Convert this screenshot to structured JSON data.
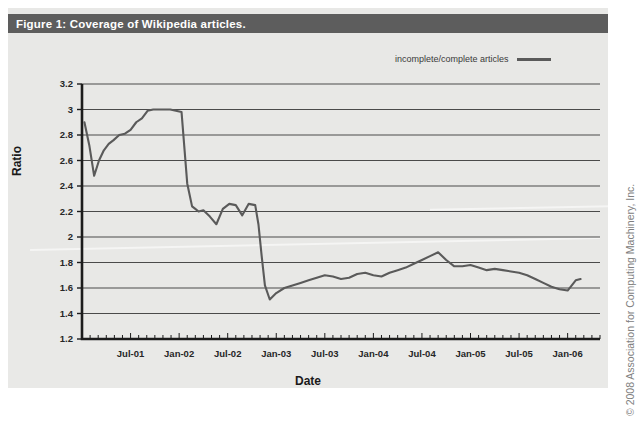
{
  "figure": {
    "caption": "Figure 1: Coverage of Wikipedia articles.",
    "caption_bar_color": "#5d5d5d",
    "panel_background": "#e8e8e6",
    "copyright": "© 2008 Association for Computing Machinery, Inc."
  },
  "legend": {
    "entries": [
      {
        "label": "incomplete/complete articles",
        "color": "#5a5a5a"
      }
    ],
    "position": "top-right"
  },
  "chart_data": {
    "type": "line",
    "title": "Figure 1: Coverage of Wikipedia articles.",
    "xlabel": "Date",
    "ylabel": "Ratio",
    "ylim": [
      1.2,
      3.2
    ],
    "yticks": [
      "3.2",
      "3",
      "2.8",
      "2.6",
      "2.4",
      "2.2",
      "2",
      "1.8",
      "1.6",
      "1.4",
      "1.2"
    ],
    "ytick_values": [
      3.2,
      3.0,
      2.8,
      2.6,
      2.4,
      2.2,
      2.0,
      1.8,
      1.6,
      1.4,
      1.2
    ],
    "xtick_labels": [
      "Jul-01",
      "Jan-02",
      "Jul-02",
      "Jan-03",
      "Jul-03",
      "Jan-04",
      "Jul-04",
      "Jan-05",
      "Jul-05",
      "Jan-06"
    ],
    "xtick_positions": [
      6,
      12,
      18,
      24,
      30,
      36,
      42,
      48,
      54,
      60
    ],
    "xlim": [
      0,
      64
    ],
    "grid": "horizontal",
    "legend_position": "top-right",
    "series": [
      {
        "name": "incomplete/complete articles",
        "color": "#5a5a5a",
        "x": [
          0.3,
          0.9,
          1.5,
          2.1,
          2.7,
          3.3,
          3.9,
          4.6,
          5.3,
          6.0,
          6.7,
          7.4,
          8.1,
          8.8,
          9.5,
          10.2,
          10.9,
          11.6,
          12.3,
          13.0,
          13.6,
          14.0,
          14.4,
          15.0,
          15.8,
          16.6,
          17.4,
          18.2,
          19.0,
          19.8,
          20.6,
          21.4,
          21.8,
          22.2,
          22.6,
          23.2,
          24.0,
          25.0,
          26.0,
          27.0,
          28.0,
          29.0,
          30.0,
          31.0,
          32.0,
          33.0,
          34.0,
          35.0,
          36.0,
          37.0,
          38.0,
          39.0,
          40.0,
          41.0,
          42.0,
          43.0,
          44.0,
          45.0,
          46.0,
          47.0,
          48.0,
          49.0,
          50.0,
          51.0,
          52.0,
          53.0,
          54.0,
          55.0,
          56.0,
          57.0,
          58.0,
          59.0,
          60.0,
          61.0,
          61.6
        ],
        "y": [
          2.9,
          2.72,
          2.48,
          2.6,
          2.68,
          2.73,
          2.76,
          2.8,
          2.81,
          2.84,
          2.9,
          2.93,
          2.99,
          3.0,
          3.0,
          3.0,
          3.0,
          2.99,
          2.98,
          2.42,
          2.24,
          2.22,
          2.2,
          2.21,
          2.16,
          2.1,
          2.22,
          2.26,
          2.25,
          2.17,
          2.26,
          2.25,
          2.1,
          1.85,
          1.62,
          1.51,
          1.56,
          1.6,
          1.62,
          1.64,
          1.66,
          1.68,
          1.7,
          1.69,
          1.67,
          1.68,
          1.71,
          1.72,
          1.7,
          1.69,
          1.72,
          1.74,
          1.76,
          1.79,
          1.82,
          1.85,
          1.88,
          1.82,
          1.77,
          1.77,
          1.78,
          1.76,
          1.74,
          1.75,
          1.74,
          1.73,
          1.72,
          1.7,
          1.67,
          1.64,
          1.61,
          1.59,
          1.58,
          1.66,
          1.67
        ]
      }
    ]
  }
}
